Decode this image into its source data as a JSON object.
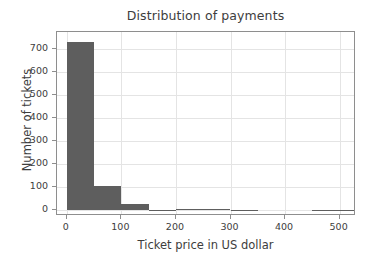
{
  "chart_data": {
    "type": "bar",
    "title": "Distribution of payments",
    "xlabel": "Ticket price in US dollar",
    "ylabel": "Number of tickets",
    "grid": true,
    "legend": false,
    "bin_width": 50,
    "xlim": [
      -18,
      530
    ],
    "ylim": [
      -25,
      772
    ],
    "xticks": [
      0,
      100,
      200,
      300,
      400,
      500
    ],
    "xtick_labels": [
      "0",
      "100",
      "200",
      "300",
      "400",
      "500"
    ],
    "yticks": [
      0,
      100,
      200,
      300,
      400,
      500,
      600,
      700
    ],
    "ytick_labels": [
      "0",
      "100",
      "200",
      "300",
      "400",
      "500",
      "600",
      "700"
    ],
    "bar_color": "#5e5e5e",
    "bins": [
      {
        "x0": 0,
        "x1": 50,
        "value": 730
      },
      {
        "x0": 50,
        "x1": 100,
        "value": 105
      },
      {
        "x0": 100,
        "x1": 150,
        "value": 28
      },
      {
        "x0": 150,
        "x1": 200,
        "value": 2
      },
      {
        "x0": 200,
        "x1": 250,
        "value": 7
      },
      {
        "x0": 250,
        "x1": 300,
        "value": 5
      },
      {
        "x0": 300,
        "x1": 350,
        "value": 1
      },
      {
        "x0": 350,
        "x1": 400,
        "value": 0
      },
      {
        "x0": 400,
        "x1": 450,
        "value": 0
      },
      {
        "x0": 450,
        "x1": 500,
        "value": 2
      },
      {
        "x0": 500,
        "x1": 530,
        "value": 1
      }
    ],
    "categories": [
      "0-50",
      "50-100",
      "100-150",
      "150-200",
      "200-250",
      "250-300",
      "300-350",
      "350-400",
      "400-450",
      "450-500",
      "500-530"
    ],
    "values": [
      730,
      105,
      28,
      2,
      7,
      5,
      1,
      0,
      0,
      2,
      1
    ]
  }
}
